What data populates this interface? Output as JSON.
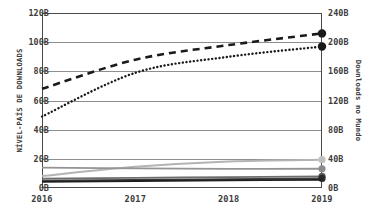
{
  "chart_data": {
    "type": "line",
    "title": "",
    "subtitle": "",
    "xlabel": "",
    "ylabel": "NÍVEL-PAÍS DE DOWNLOADS",
    "ylabel_right": "Downloads no Mundo",
    "categories": [
      "2016",
      "2017",
      "2018",
      "2019"
    ],
    "x": [
      2016,
      2017,
      2018,
      2019
    ],
    "ylim": [
      0,
      120
    ],
    "ylim_right": [
      0,
      240
    ],
    "yticks": [
      "0B",
      "20B",
      "40B",
      "60B",
      "80B",
      "100B",
      "120B"
    ],
    "ytick_values": [
      0,
      20,
      40,
      60,
      80,
      100,
      120
    ],
    "yticks_right": [
      "0B",
      "40B",
      "80B",
      "120B",
      "160B",
      "200B",
      "240B"
    ],
    "ytick_values_right": [
      0,
      40,
      80,
      120,
      160,
      200,
      240
    ],
    "grid": true,
    "grid_axis": "y",
    "legend": false,
    "legend_position": "none",
    "units": "B",
    "series": [
      {
        "name": "world-downloads-dashed",
        "axis": "right",
        "style": "dashed",
        "color": "#1a1a1a",
        "width": 2.6,
        "marker": "circle",
        "marker_color": "#1a1a1a",
        "marker_at": [
          2019
        ],
        "values": [
          136,
          176,
          196,
          212
        ],
        "values_left_scale": [
          68,
          88,
          98,
          106
        ]
      },
      {
        "name": "world-downloads-dotted",
        "axis": "right",
        "style": "dotted",
        "color": "#1a1a1a",
        "width": 2.4,
        "marker": "circle",
        "marker_color": "#1a1a1a",
        "marker_at": [
          2019
        ],
        "values": [
          98,
          158,
          180,
          194
        ],
        "values_left_scale": [
          49,
          79,
          90,
          97
        ]
      },
      {
        "name": "country-downloads-light",
        "axis": "left",
        "style": "solid",
        "color": "#b4b4b4",
        "width": 2.0,
        "marker": "circle",
        "marker_color": "#c0c0c0",
        "marker_at": [
          2019
        ],
        "values": [
          8.2,
          14.5,
          18.2,
          19.4
        ]
      },
      {
        "name": "country-downloads-medium",
        "axis": "left",
        "style": "solid",
        "color": "#949494",
        "width": 1.8,
        "marker": "circle",
        "marker_color": "#8c8c8c",
        "marker_at": [
          2019
        ],
        "values": [
          14.0,
          13.4,
          13.1,
          13.2
        ]
      },
      {
        "name": "country-downloads-dark-a",
        "axis": "left",
        "style": "solid",
        "color": "#6e6e6e",
        "width": 1.8,
        "marker": "circle",
        "marker_color": "#5a5a5a",
        "marker_at": [
          2019
        ],
        "values": [
          6.4,
          7.0,
          7.4,
          8.0
        ]
      },
      {
        "name": "country-downloads-dark-b",
        "axis": "left",
        "style": "solid",
        "color": "#3c3c3c",
        "width": 1.8,
        "marker": "circle",
        "marker_color": "#2a2a2a",
        "marker_at": [
          2019
        ],
        "values": [
          5.0,
          5.6,
          6.0,
          6.6
        ]
      },
      {
        "name": "country-downloads-darkest",
        "axis": "left",
        "style": "solid",
        "color": "#1f1f1f",
        "width": 1.8,
        "marker": "none",
        "marker_color": "#1f1f1f",
        "marker_at": [],
        "values": [
          4.2,
          4.8,
          5.2,
          5.6
        ]
      }
    ]
  },
  "colors": {
    "axis": "#4a4a4a",
    "grid": "#8e8e8e",
    "text": "#3c3c3c",
    "background": "#ffffff"
  }
}
